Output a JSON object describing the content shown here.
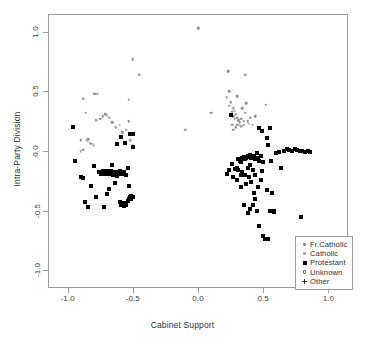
{
  "chart_data": {
    "type": "scatter",
    "title": "",
    "xlabel": "Cabinet Support",
    "ylabel": "Intra-Party Division",
    "xlim": [
      -1.15,
      1.15
    ],
    "ylim": [
      -1.15,
      1.15
    ],
    "xticks": [
      -1.0,
      -0.5,
      0.0,
      0.5,
      1.0
    ],
    "xticklabels": [
      "-1.0",
      "-0.5",
      "0.0",
      "0.5",
      "1.0"
    ],
    "yticks": [
      1.0,
      0.5,
      0.0,
      -0.5,
      -1.0
    ],
    "yticklabels": [
      "1.0",
      "0.5",
      "0.0",
      "-0.5",
      "-1.0"
    ],
    "grid": false,
    "legend_position": "bottom-right",
    "legend": [
      {
        "label": "Fr.Catholic",
        "marker": "small-dot",
        "color": "#8c8c8c"
      },
      {
        "label": "Catholic",
        "marker": "small-dot",
        "color": "#a6a6a6"
      },
      {
        "label": "Protestant",
        "marker": "filled-square",
        "color": "#000000"
      },
      {
        "label": "Unknown",
        "marker": "open-circle",
        "color": "#2e2e2e"
      },
      {
        "label": "Other",
        "marker": "plus",
        "color": "#2e2e2e"
      }
    ],
    "series": [
      {
        "name": "Fr.Catholic",
        "marker": "small-dot",
        "color": "#8c8c8c",
        "points": [
          [
            -0.96,
            0.2
          ],
          [
            -0.88,
            0.44
          ],
          [
            -0.9,
            0.09
          ],
          [
            -0.88,
            0.01
          ],
          [
            -0.86,
            0.32
          ],
          [
            -0.8,
            0.48
          ],
          [
            -0.79,
            0.48
          ],
          [
            -0.77,
            0.48
          ],
          [
            -0.84,
            0.1
          ],
          [
            -0.82,
            0.06
          ],
          [
            -0.75,
            0.27
          ],
          [
            -0.73,
            0.29
          ],
          [
            -0.71,
            0.31
          ],
          [
            -0.66,
            0.24
          ],
          [
            -0.63,
            0.2
          ],
          [
            -0.58,
            0.16
          ],
          [
            -0.53,
            0.43
          ],
          [
            -0.53,
            0.25
          ],
          [
            -0.5,
            0.77
          ],
          [
            -0.45,
            0.64
          ],
          [
            -0.1,
            0.18
          ],
          [
            0.0,
            1.03
          ],
          [
            0.1,
            0.32
          ],
          [
            0.23,
            0.67
          ],
          [
            0.24,
            0.5
          ],
          [
            0.25,
            0.41
          ],
          [
            0.26,
            0.33
          ],
          [
            0.27,
            0.29
          ],
          [
            0.28,
            0.27
          ],
          [
            0.29,
            0.31
          ],
          [
            0.3,
            0.28
          ],
          [
            0.31,
            0.26
          ],
          [
            0.32,
            0.24
          ],
          [
            0.33,
            0.27
          ],
          [
            0.34,
            0.36
          ],
          [
            0.3,
            0.46
          ],
          [
            0.36,
            0.64
          ],
          [
            0.37,
            0.4
          ],
          [
            0.38,
            0.25
          ],
          [
            0.4,
            0.28
          ],
          [
            0.44,
            0.29
          ],
          [
            0.52,
            0.39
          ],
          [
            0.3,
            0.22
          ],
          [
            0.29,
            0.2
          ],
          [
            0.35,
            0.22
          ],
          [
            0.26,
            0.22
          ],
          [
            0.27,
            0.18
          ]
        ]
      },
      {
        "name": "Catholic",
        "marker": "small-dot",
        "color": "#a6a6a6",
        "points": [
          [
            -0.9,
            0.0
          ],
          [
            -0.85,
            0.09
          ],
          [
            -0.83,
            0.07
          ],
          [
            -0.8,
            0.05
          ],
          [
            -0.78,
            0.26
          ],
          [
            -0.7,
            0.3
          ],
          [
            -0.68,
            0.28
          ],
          [
            -0.6,
            0.22
          ],
          [
            -0.55,
            0.18
          ],
          [
            -0.52,
            0.09
          ],
          [
            -0.5,
            0.05
          ],
          [
            0.22,
            0.45
          ],
          [
            0.24,
            0.38
          ],
          [
            0.28,
            0.34
          ],
          [
            0.31,
            0.22
          ],
          [
            0.33,
            0.21
          ],
          [
            0.35,
            0.25
          ],
          [
            0.39,
            0.23
          ],
          [
            0.42,
            0.22
          ],
          [
            0.36,
            0.32
          ],
          [
            0.27,
            0.36
          ]
        ]
      },
      {
        "name": "Protestant",
        "marker": "filled-square",
        "color": "#000000",
        "points": [
          [
            -0.96,
            0.2
          ],
          [
            -0.94,
            -0.08
          ],
          [
            -0.9,
            -0.22
          ],
          [
            -0.88,
            -0.23
          ],
          [
            -0.87,
            -0.43
          ],
          [
            -0.84,
            -0.47
          ],
          [
            -0.82,
            -0.29
          ],
          [
            -0.8,
            -0.13
          ],
          [
            -0.76,
            -0.18
          ],
          [
            -0.74,
            -0.19
          ],
          [
            -0.73,
            -0.17
          ],
          [
            -0.72,
            -0.18
          ],
          [
            -0.71,
            -0.19
          ],
          [
            -0.7,
            -0.17
          ],
          [
            -0.7,
            -0.36
          ],
          [
            -0.69,
            -0.18
          ],
          [
            -0.68,
            -0.19
          ],
          [
            -0.67,
            -0.17
          ],
          [
            -0.68,
            -0.32
          ],
          [
            -0.66,
            -0.18
          ],
          [
            -0.65,
            -0.2
          ],
          [
            -0.64,
            -0.19
          ],
          [
            -0.66,
            -0.12
          ],
          [
            -0.63,
            -0.18
          ],
          [
            -0.62,
            -0.21
          ],
          [
            -0.62,
            0.06
          ],
          [
            -0.61,
            -0.19
          ],
          [
            -0.6,
            -0.17
          ],
          [
            -0.6,
            -0.43
          ],
          [
            -0.59,
            -0.45
          ],
          [
            -0.59,
            0.12
          ],
          [
            -0.58,
            -0.44
          ],
          [
            -0.58,
            -0.19
          ],
          [
            -0.57,
            -0.46
          ],
          [
            -0.57,
            -0.18
          ],
          [
            -0.56,
            -0.44
          ],
          [
            -0.56,
            0.07
          ],
          [
            -0.55,
            -0.45
          ],
          [
            -0.55,
            -0.2
          ],
          [
            -0.54,
            -0.42
          ],
          [
            -0.54,
            -0.14
          ],
          [
            -0.53,
            -0.4
          ],
          [
            -0.53,
            -0.29
          ],
          [
            -0.52,
            -0.39
          ],
          [
            -0.52,
            0.14
          ],
          [
            -0.51,
            -0.38
          ],
          [
            -0.51,
            -0.4
          ],
          [
            -0.5,
            -0.39
          ],
          [
            -0.5,
            0.14
          ],
          [
            -0.5,
            0.03
          ],
          [
            -0.64,
            -0.27
          ],
          [
            -0.72,
            -0.47
          ],
          [
            -0.78,
            -0.39
          ],
          [
            0.22,
            -0.19
          ],
          [
            0.24,
            -0.16
          ],
          [
            0.25,
            0.3
          ],
          [
            0.26,
            -0.11
          ],
          [
            0.28,
            -0.15
          ],
          [
            0.3,
            -0.14
          ],
          [
            0.31,
            -0.07
          ],
          [
            0.32,
            -0.08
          ],
          [
            0.33,
            -0.09
          ],
          [
            0.33,
            -0.2
          ],
          [
            0.34,
            -0.06
          ],
          [
            0.34,
            -0.18
          ],
          [
            0.35,
            -0.05
          ],
          [
            0.35,
            -0.45
          ],
          [
            0.36,
            -0.07
          ],
          [
            0.36,
            -0.2
          ],
          [
            0.37,
            -0.06
          ],
          [
            0.37,
            -0.28
          ],
          [
            0.38,
            -0.04
          ],
          [
            0.38,
            -0.14
          ],
          [
            0.39,
            -0.05
          ],
          [
            0.39,
            -0.22
          ],
          [
            0.4,
            -0.03
          ],
          [
            0.4,
            -0.12
          ],
          [
            0.41,
            -0.06
          ],
          [
            0.41,
            -0.26
          ],
          [
            0.42,
            -0.04
          ],
          [
            0.42,
            -0.16
          ],
          [
            0.43,
            -0.05
          ],
          [
            0.43,
            -0.35
          ],
          [
            0.44,
            -0.07
          ],
          [
            0.44,
            -0.2
          ],
          [
            0.45,
            -0.02
          ],
          [
            0.45,
            -0.5
          ],
          [
            0.46,
            -0.06
          ],
          [
            0.46,
            -0.3
          ],
          [
            0.47,
            -0.08
          ],
          [
            0.47,
            -0.63
          ],
          [
            0.48,
            -0.04
          ],
          [
            0.48,
            -0.24
          ],
          [
            0.49,
            -0.17
          ],
          [
            0.5,
            -0.09
          ],
          [
            0.5,
            -0.71
          ],
          [
            0.51,
            -0.74
          ],
          [
            0.52,
            -0.74
          ],
          [
            0.53,
            -0.33
          ],
          [
            0.54,
            -0.74
          ],
          [
            0.55,
            -0.5
          ],
          [
            0.56,
            -0.08
          ],
          [
            0.57,
            -0.35
          ],
          [
            0.58,
            -0.51
          ],
          [
            0.58,
            -0.5
          ],
          [
            0.54,
            0.05
          ],
          [
            0.55,
            0.19
          ],
          [
            0.49,
            0.17
          ],
          [
            0.47,
            0.19
          ],
          [
            0.53,
            0.11
          ],
          [
            0.6,
            -0.02
          ],
          [
            0.62,
            -0.01
          ],
          [
            0.64,
            -0.14
          ],
          [
            0.66,
            0.0
          ],
          [
            0.68,
            0.02
          ],
          [
            0.7,
            0.01
          ],
          [
            0.72,
            0.0
          ],
          [
            0.74,
            0.02
          ],
          [
            0.76,
            0.01
          ],
          [
            0.78,
            0.0
          ],
          [
            0.8,
            0.0
          ],
          [
            0.82,
            -0.01
          ],
          [
            0.84,
            0.0
          ],
          [
            0.86,
            -0.01
          ],
          [
            0.79,
            -0.55
          ],
          [
            0.44,
            -0.4
          ],
          [
            0.42,
            -0.45
          ],
          [
            0.4,
            -0.49
          ],
          [
            0.38,
            -0.52
          ],
          [
            0.3,
            -0.24
          ],
          [
            0.27,
            -0.22
          ],
          [
            0.33,
            -0.3
          ],
          [
            0.31,
            -0.16
          ]
        ]
      },
      {
        "name": "Unknown",
        "marker": "open-circle",
        "color": "#2e2e2e",
        "points": []
      },
      {
        "name": "Other",
        "marker": "plus",
        "color": "#2e2e2e",
        "points": []
      }
    ]
  }
}
